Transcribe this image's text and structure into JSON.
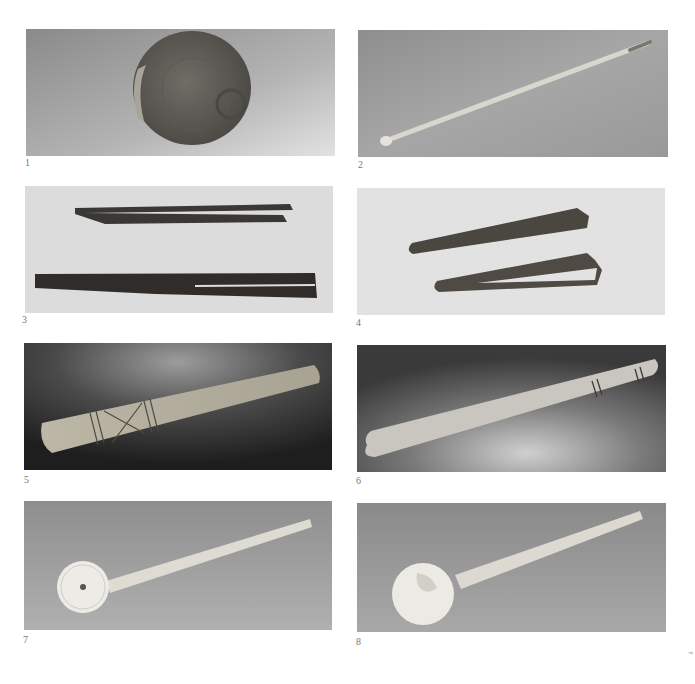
{
  "page": {
    "background": "#ffffff",
    "layout": "2-column grid of 8 photographic plates"
  },
  "plates": [
    {
      "number": "1",
      "subject": "round corroded bronze vessel with ring handle",
      "background_tone": "medium grey gradient"
    },
    {
      "number": "2",
      "subject": "slender bone probe with small knob end",
      "background_tone": "medium grey"
    },
    {
      "number": "3",
      "subject": "two dark iron tweezers",
      "background_tone": "light grey"
    },
    {
      "number": "4",
      "subject": "two bronze tweezers",
      "background_tone": "light grey"
    },
    {
      "number": "5",
      "subject": "incised bone spatula with cross-hatch decoration",
      "background_tone": "dark grey with spotlight"
    },
    {
      "number": "6",
      "subject": "bone spatula with incised bands near end",
      "background_tone": "dark grey with spotlight"
    },
    {
      "number": "7",
      "subject": "bone spoon with round bowl and central hole",
      "background_tone": "medium grey"
    },
    {
      "number": "8",
      "subject": "bone spoon with round bowl and residue",
      "background_tone": "medium grey"
    }
  ],
  "corner_mark": "~"
}
